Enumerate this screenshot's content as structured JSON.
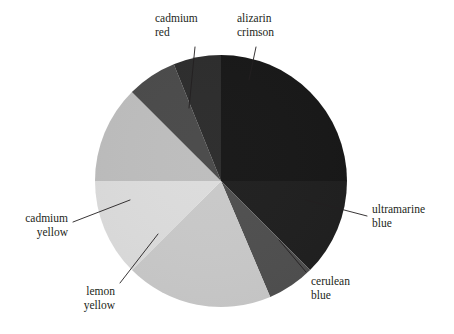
{
  "figure": {
    "kind": "color-wheel",
    "background_color": "#ffffff",
    "text_color": "#231f20",
    "center": {
      "x": 221,
      "y": 181
    },
    "radius": 126
  },
  "chart_data": {
    "type": "pie",
    "title": "",
    "xlabel": "",
    "ylabel": "",
    "legend_position": "callout-labels",
    "grid": false,
    "note": "Grayscale reproduction of a painter's colour wheel; eight pigment wedges, six of them labelled with leader lines.",
    "categories": [
      "alizarin crimson",
      "ultramarine blue",
      "cerulean blue",
      "unlabelled pale wedge",
      "lemon yellow",
      "cadmium yellow",
      "unlabelled mid-grey wedge",
      "cadmium red"
    ],
    "values": [
      90,
      45,
      22,
      68,
      45,
      45,
      23,
      22
    ],
    "slices": [
      {
        "label": "alizarin crimson",
        "start_angle": 0,
        "end_angle": 90,
        "value": 90,
        "color": "#171717",
        "labelled": true
      },
      {
        "label": "ultramarine blue",
        "start_angle": 90,
        "end_angle": 135,
        "value": 45,
        "color": "#1f1f1f",
        "labelled": true
      },
      {
        "label": "cerulean blue",
        "start_angle": 135,
        "end_angle": 157,
        "value": 22,
        "color": "#4f4f4f",
        "labelled": true
      },
      {
        "label": "",
        "start_angle": 157,
        "end_angle": 225,
        "value": 68,
        "color": "#c9c9c9",
        "labelled": false
      },
      {
        "label": "lemon yellow",
        "start_angle": 225,
        "end_angle": 270,
        "value": 45,
        "color": "#dcdcdc",
        "labelled": true
      },
      {
        "label": "cadmium yellow",
        "start_angle": 270,
        "end_angle": 315,
        "value": 45,
        "color": "#bdbdbd",
        "labelled": true
      },
      {
        "label": "",
        "start_angle": 315,
        "end_angle": 338,
        "value": 23,
        "color": "#4a4a4a",
        "labelled": false
      },
      {
        "label": "cadmium red",
        "start_angle": 338,
        "end_angle": 360,
        "value": 22,
        "color": "#2c2c2c",
        "labelled": true
      }
    ]
  },
  "labels": {
    "cadmium_red": {
      "line1": "cadmium",
      "line2": "red"
    },
    "alizarin_crimson": {
      "line1": "alizarin",
      "line2": "crimson"
    },
    "ultramarine_blue": {
      "line1": "ultramarine",
      "line2": "blue"
    },
    "cerulean_blue": {
      "line1": "cerulean",
      "line2": "blue"
    },
    "lemon_yellow": {
      "line1": "lemon",
      "line2": "yellow"
    },
    "cadmium_yellow": {
      "line1": "cadmium",
      "line2": "yellow"
    }
  }
}
